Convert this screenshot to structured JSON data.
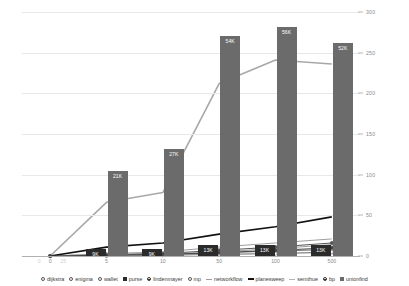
{
  "chart_data": {
    "type": "bar",
    "title": "",
    "subtitle": "",
    "xlabel": "",
    "ylabel": "",
    "categories": [
      "0",
      "5",
      "10",
      "50",
      "100",
      "500"
    ],
    "x_ticks": [
      "0",
      "5",
      "10",
      "50",
      "100",
      "500"
    ],
    "x_ghost_ticks": [
      "0",
      "25"
    ],
    "y_right_ticks": [
      "0",
      "50",
      "100",
      "150",
      "200",
      "250",
      "300"
    ],
    "ylim": [
      0,
      300
    ],
    "y_right_label": "",
    "grid": true,
    "legend_position": "bottom",
    "bar_value_labels": {
      "unionfind": [
        "",
        "21K",
        "27K",
        "54K",
        "56K",
        "52K"
      ],
      "purse": [
        "",
        "9K",
        "9K",
        "13K",
        "13K",
        "13K"
      ]
    },
    "series": [
      {
        "name": "dijkstra",
        "marker": "circle-open",
        "type": "line",
        "color": "#7a7a7a",
        "values": [
          0,
          1,
          2,
          4,
          6,
          8
        ]
      },
      {
        "name": "enigma",
        "marker": "circle-open",
        "type": "line",
        "color": "#9a9a9a",
        "values": [
          0,
          1,
          2,
          5,
          9,
          14
        ]
      },
      {
        "name": "wallet",
        "marker": "circle-open",
        "type": "line",
        "color": "#bdbdbd",
        "values": [
          0,
          1,
          1,
          2,
          3,
          4
        ]
      },
      {
        "name": "purse",
        "marker": "square-filled",
        "type": "bar",
        "color": "#2b2b2b",
        "values": [
          0,
          9,
          9,
          13,
          13,
          13
        ],
        "value_labels": [
          "",
          "9K",
          "9K",
          "13K",
          "13K",
          "13K"
        ]
      },
      {
        "name": "lindenmayer",
        "marker": "circle-dot",
        "type": "line",
        "color": "#555555",
        "values": [
          0,
          2,
          3,
          7,
          11,
          16
        ]
      },
      {
        "name": "mp",
        "marker": "circle-open",
        "type": "line",
        "color": "#888888",
        "values": [
          0,
          0,
          1,
          2,
          3,
          5
        ]
      },
      {
        "name": "networkflow",
        "marker": "line",
        "type": "line",
        "color": "#9e9e9e",
        "values": [
          0,
          3,
          5,
          11,
          16,
          21
        ]
      },
      {
        "name": "planesweep",
        "marker": "line-bold",
        "type": "line",
        "color": "#111111",
        "values": [
          0,
          11,
          16,
          27,
          36,
          48
        ]
      },
      {
        "name": "semthue",
        "marker": "line-light",
        "type": "line",
        "color": "#a8a8a8",
        "values": [
          0,
          66,
          78,
          212,
          241,
          236
        ]
      },
      {
        "name": "bp",
        "marker": "circle-dot",
        "type": "line",
        "color": "#444444",
        "values": [
          0,
          1,
          2,
          4,
          7,
          10
        ]
      },
      {
        "name": "unionfind",
        "marker": "square-filled",
        "type": "bar",
        "color": "#6b6b6b",
        "values": [
          0,
          105,
          131,
          271,
          281,
          262
        ],
        "value_labels": [
          "",
          "21K",
          "27K",
          "54K",
          "56K",
          "52K"
        ]
      }
    ]
  },
  "legend": {
    "items": [
      {
        "label": "dijkstra",
        "marker": "circle-open",
        "color": "#555555"
      },
      {
        "label": "enigma",
        "marker": "circle-open",
        "color": "#555555"
      },
      {
        "label": "wallet",
        "marker": "circle-open",
        "color": "#555555"
      },
      {
        "label": "purse",
        "marker": "square-filled",
        "color": "#2b2b2b"
      },
      {
        "label": "lindenmayer",
        "marker": "circle-dot",
        "color": "#333333"
      },
      {
        "label": "mp",
        "marker": "circle-open",
        "color": "#555555"
      },
      {
        "label": "networkflow",
        "marker": "line",
        "color": "#9e9e9e"
      },
      {
        "label": "planesweep",
        "marker": "line-bold",
        "color": "#111111"
      },
      {
        "label": "semthue",
        "marker": "line-light",
        "color": "#b5b5b5"
      },
      {
        "label": "bp",
        "marker": "circle-dot",
        "color": "#333333"
      },
      {
        "label": "unionfind",
        "marker": "square-filled",
        "color": "#6b6b6b"
      }
    ]
  },
  "colors": {
    "bar_unionfind": "#6b6b6b",
    "bar_purse": "#2b2b2b",
    "line_semthue": "#a8a8a8",
    "line_planesweep": "#111111",
    "grid": "#e8e8e8",
    "axis": "#b0b0b0",
    "tick_text": "#8a8a8a"
  }
}
